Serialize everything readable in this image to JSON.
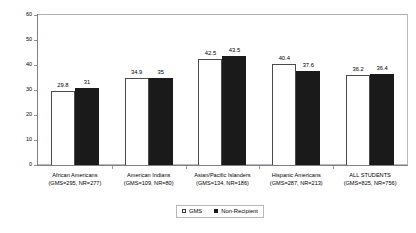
{
  "chart_data": {
    "type": "bar",
    "title": "",
    "xlabel": "",
    "ylabel": "",
    "ylim": [
      0,
      60
    ],
    "ytick_step": 10,
    "yticks": [
      "0",
      "10",
      "20",
      "30",
      "40",
      "50",
      "60"
    ],
    "grid": false,
    "legend_position": "bottom-center",
    "categories": [
      "African Americans",
      "American Indians",
      "Asian/Pacific Islanders",
      "Hispanic Americans",
      "ALL STUDENTS"
    ],
    "category_sublabels": [
      "(GMS=295, NR=277)",
      "(GMS=109, NR=80)",
      "(GMS=134, NR=186)",
      "(GMS=287, NR=213)",
      "(GMS=825, NR=756)"
    ],
    "series": [
      {
        "name": "GMS",
        "color": "#ffffff",
        "edge_color": "#4a4a4a",
        "values": [
          29.8,
          34.9,
          42.5,
          40.4,
          36.2
        ],
        "labels": [
          "29.8",
          "34.9",
          "42.5",
          "40.4",
          "36.2"
        ]
      },
      {
        "name": "Non-Recipient",
        "color": "#1a1a1a",
        "edge_color": "#1a1a1a",
        "values": [
          31,
          35,
          43.5,
          37.6,
          36.4
        ],
        "labels": [
          "31",
          "35",
          "43.5",
          "37.6",
          "36.4"
        ]
      }
    ]
  },
  "legend": {
    "items": [
      {
        "label": "GMS",
        "swatch": "open-square"
      },
      {
        "label": "Non-Recipient",
        "swatch": "filled-square"
      }
    ]
  }
}
